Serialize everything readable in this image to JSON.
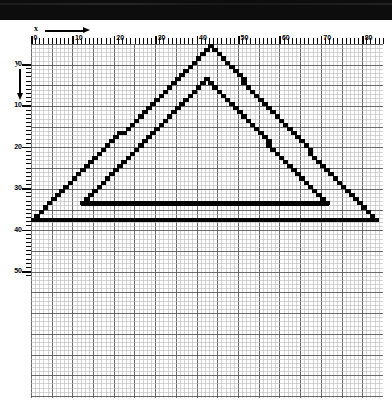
{
  "header": {
    "title": "",
    "style": "solid-black-bar"
  },
  "axes": {
    "x": {
      "label": "x",
      "direction": "right",
      "ticks": [
        0,
        10,
        20,
        30,
        40,
        50,
        60,
        70,
        80
      ],
      "minor_tick_step": 1,
      "range": [
        0,
        85
      ]
    },
    "y": {
      "label": "y",
      "direction": "down",
      "ticks": [
        0,
        10,
        20,
        30,
        40,
        50
      ],
      "minor_tick_step": 1,
      "range": [
        0,
        51
      ]
    }
  },
  "grid": {
    "minor_color": "#b9b9b9",
    "major_color": "#5a5a5a",
    "major_every": 5,
    "background": "#ffffff",
    "cell_px": 4.14
  },
  "chart_data": {
    "type": "line",
    "title": "",
    "subtitle": "",
    "xlabel": "x",
    "ylabel": "y",
    "xlim": [
      0,
      85
    ],
    "ylim": [
      0,
      51
    ],
    "y_axis_inverted": true,
    "grid": true,
    "legend": "none",
    "render_style": "aliased-raster-staircase",
    "stroke_color": "#000000",
    "stroke_px": 3,
    "series": [
      {
        "name": "outer-triangle",
        "closed": true,
        "points": [
          {
            "x": 43,
            "y": 0
          },
          {
            "x": 82.5,
            "y": 42
          },
          {
            "x": 0,
            "y": 42
          }
        ]
      },
      {
        "name": "inner-triangle",
        "closed": true,
        "points": [
          {
            "x": 42,
            "y": 8
          },
          {
            "x": 71,
            "y": 38
          },
          {
            "x": 12,
            "y": 38
          }
        ]
      }
    ],
    "annotations": [
      {
        "name": "outer-base-rule",
        "type": "horizontal-rule",
        "y": 42,
        "x_from": 0,
        "x_to": 82.5
      },
      {
        "name": "inner-base-rule",
        "type": "horizontal-rule",
        "y": 38,
        "x_from": 12,
        "x_to": 71
      }
    ]
  }
}
